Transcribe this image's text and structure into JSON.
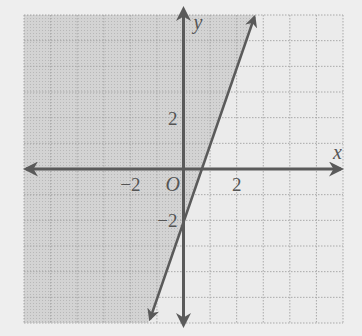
{
  "chart_data": {
    "type": "inequality-graph",
    "title": "",
    "xlabel": "x",
    "ylabel": "y",
    "origin_label": "O",
    "xlim": [
      -6,
      6
    ],
    "ylim": [
      -6,
      6
    ],
    "grid": true,
    "grid_step": 1,
    "x_tick_labels": [
      {
        "value": -2,
        "label": "−2"
      },
      {
        "value": 2,
        "label": "2"
      }
    ],
    "y_tick_labels": [
      {
        "value": 2,
        "label": "2"
      },
      {
        "value": -2,
        "label": "−2"
      }
    ],
    "boundary_line": {
      "equation": "y = 3x - 2",
      "slope": 3,
      "intercept": -2,
      "style": "solid"
    },
    "inequality": "y >= 3x - 2",
    "shaded_region": "left/above boundary line",
    "colors": {
      "shade": "#cdcdcd",
      "unshaded": "#ebebeb",
      "grid": "#a9a9a9",
      "axes": "#5a5a5a",
      "line": "#5a5a5a"
    }
  }
}
